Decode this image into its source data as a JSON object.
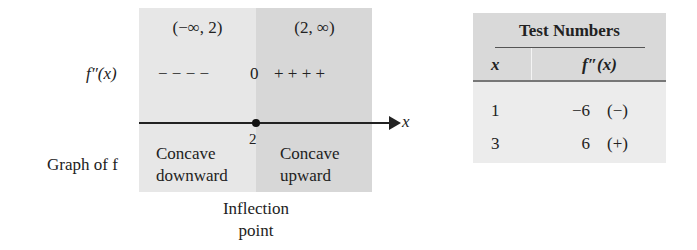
{
  "sign_chart": {
    "intervals": [
      {
        "label": "(−∞, 2)",
        "sign": "− − − −",
        "concavity_line1": "Concave",
        "concavity_line2": "downward",
        "fill": "#e7e7e7"
      },
      {
        "label": "(2, ∞)",
        "sign": "+ + + +",
        "concavity_line1": "Concave",
        "concavity_line2": "upward",
        "fill": "#d7d7d7"
      }
    ],
    "row_labels": {
      "derivative": "f″(x)",
      "graph": "Graph of f"
    },
    "zero_marker": "0",
    "axis_label": "x",
    "critical_point": "2",
    "annotation_line1": "Inflection",
    "annotation_line2": "point"
  },
  "test_table": {
    "title": "Test Numbers",
    "columns": [
      "x",
      "f″(x)"
    ],
    "rows": [
      {
        "x": "1",
        "value": "−6",
        "sign": "(−)"
      },
      {
        "x": "3",
        "value": "6",
        "sign": "(+)"
      }
    ],
    "header_fill": "#d9d9d9",
    "body_fill": "#ececec"
  }
}
